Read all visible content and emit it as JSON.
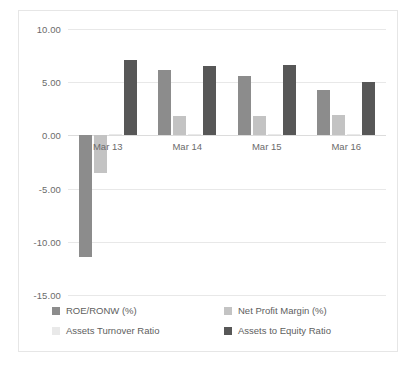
{
  "chart_data": {
    "type": "bar",
    "title": "",
    "subtitle": "",
    "xlabel": "",
    "ylabel": "",
    "categories": [
      "Mar 13",
      "Mar 14",
      "Mar 15",
      "Mar 16"
    ],
    "ylim": [
      -15.0,
      10.0
    ],
    "yticks": [
      10.0,
      5.0,
      0.0,
      -5.0,
      -10.0,
      -15.0
    ],
    "ytick_labels": [
      "10.00",
      "5.00",
      "0.00",
      "-5.00",
      "-10.00",
      "-15.00"
    ],
    "grid": true,
    "legend_position": "bottom",
    "series": [
      {
        "name": "ROE/RONW (%)",
        "color": "#8c8c8c",
        "values": [
          -11.45,
          6.15,
          5.6,
          4.3
        ]
      },
      {
        "name": "Net Profit Margin (%)",
        "color": "#c3c3c3",
        "values": [
          -3.55,
          1.8,
          1.8,
          1.9
        ]
      },
      {
        "name": "Assets Turnover Ratio",
        "color": "#e9e9e9",
        "values": [
          0.15,
          0.15,
          0.15,
          0.15
        ]
      },
      {
        "name": "Assets to Equity Ratio",
        "color": "#575757",
        "values": [
          7.05,
          6.5,
          6.65,
          5.05
        ]
      }
    ]
  },
  "axis": {
    "tick_0": "10.00",
    "tick_1": "5.00",
    "tick_2": "0.00",
    "tick_3": "-5.00",
    "tick_4": "-10.00",
    "tick_5": "-15.00"
  },
  "categories": {
    "c0": "Mar 13",
    "c1": "Mar 14",
    "c2": "Mar 15",
    "c3": "Mar 16"
  },
  "legend": {
    "items": [
      {
        "label": "ROE/RONW (%)",
        "color": "#8c8c8c"
      },
      {
        "label": "Net Profit Margin (%)",
        "color": "#c3c3c3"
      },
      {
        "label": "Assets Turnover Ratio",
        "color": "#e9e9e9"
      },
      {
        "label": "Assets to Equity Ratio",
        "color": "#575757"
      }
    ]
  }
}
